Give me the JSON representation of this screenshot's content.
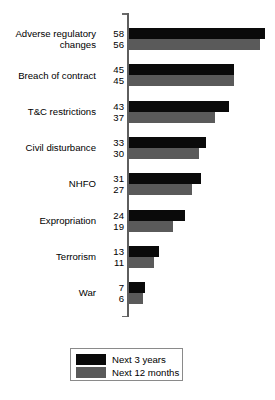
{
  "chart_data": {
    "type": "bar",
    "orientation": "horizontal",
    "title": "",
    "xlabel": "",
    "ylabel": "",
    "grid": false,
    "xlim": [
      0,
      60
    ],
    "legend_position": "bottom",
    "categories": [
      "Adverse regulatory\nchanges",
      "Breach of contract",
      "T&C restrictions",
      "Civil disturbance",
      "NHFO",
      "Expropriation",
      "Terrorism",
      "War"
    ],
    "series": [
      {
        "name": "Next 3 years",
        "color": "#0a0a0a",
        "values": [
          58,
          45,
          43,
          33,
          31,
          24,
          13,
          7
        ]
      },
      {
        "name": "Next 12 months",
        "color": "#5a5a5a",
        "values": [
          56,
          45,
          37,
          30,
          27,
          19,
          11,
          6
        ]
      }
    ]
  },
  "legend": {
    "items": [
      {
        "label": "Next 3 years",
        "color": "#0a0a0a"
      },
      {
        "label": "Next 12 months",
        "color": "#5a5a5a"
      }
    ]
  },
  "axis": {
    "line_color": "#5e5e5e"
  }
}
